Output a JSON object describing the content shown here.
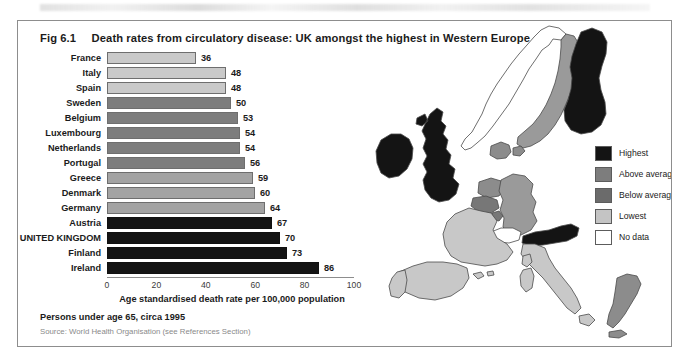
{
  "figure": {
    "number": "Fig 6.1",
    "title": "Death rates from circulatory disease:  UK amongst the highest in Western Europe",
    "footnote": "Persons under age 65, circa 1995",
    "source": "Source: World Health Organisation (see References Section)"
  },
  "chart_data": {
    "type": "bar",
    "orientation": "horizontal",
    "title": "Death rates from circulatory disease: UK amongst the highest in Western Europe",
    "xlabel": "Age standardised death rate per 100,000 population",
    "ylabel": "",
    "xlim": [
      0,
      100
    ],
    "xticks": [
      "0",
      "20",
      "40",
      "60",
      "80",
      "100"
    ],
    "grid": false,
    "legend_position": "map-right",
    "categories": [
      "France",
      "Italy",
      "Spain",
      "Sweden",
      "Belgium",
      "Luxembourg",
      "Netherlands",
      "Portugal",
      "Greece",
      "Denmark",
      "Germany",
      "Austria",
      "UNITED KINGDOM",
      "Finland",
      "Ireland"
    ],
    "values": [
      36,
      48,
      48,
      50,
      53,
      54,
      54,
      56,
      59,
      60,
      64,
      67,
      70,
      73,
      86
    ],
    "bands": [
      "Lowest",
      "Lowest",
      "Lowest",
      "Below average",
      "Below average",
      "Below average",
      "Below average",
      "Below average",
      "Above average",
      "Above average",
      "Above average",
      "Highest",
      "Highest",
      "Highest",
      "Highest"
    ],
    "bar_colors": [
      "#c9c9c9",
      "#c9c9c9",
      "#c9c9c9",
      "#7d7d7d",
      "#7d7d7d",
      "#7d7d7d",
      "#7d7d7d",
      "#7d7d7d",
      "#a3a3a3",
      "#a3a3a3",
      "#a3a3a3",
      "#141414",
      "#141414",
      "#141414",
      "#141414"
    ]
  },
  "legend": {
    "items": [
      {
        "label": "Highest",
        "color": "#141414"
      },
      {
        "label": "Above average",
        "color": "#7d7d7d"
      },
      {
        "label": "Below average",
        "color": "#6b6b6b"
      },
      {
        "label": "Lowest",
        "color": "#c4c4c4"
      },
      {
        "label": "No data",
        "color": "#ffffff"
      }
    ]
  },
  "map": {
    "name": "western-europe-choropleth",
    "regions": [
      {
        "name": "Ireland",
        "band": "Highest",
        "color": "#141414"
      },
      {
        "name": "United Kingdom",
        "band": "Highest",
        "color": "#141414"
      },
      {
        "name": "Finland",
        "band": "Highest",
        "color": "#141414"
      },
      {
        "name": "Austria",
        "band": "Highest",
        "color": "#141414"
      },
      {
        "name": "Sweden",
        "band": "Below average",
        "color": "#9a9a9a"
      },
      {
        "name": "Denmark",
        "band": "Above average",
        "color": "#8c8c8c"
      },
      {
        "name": "Netherlands",
        "band": "Below average",
        "color": "#8c8c8c"
      },
      {
        "name": "Belgium",
        "band": "Below average",
        "color": "#777777"
      },
      {
        "name": "Luxembourg",
        "band": "Below average",
        "color": "#777777"
      },
      {
        "name": "Germany",
        "band": "Above average",
        "color": "#9a9a9a"
      },
      {
        "name": "France",
        "band": "Lowest",
        "color": "#c8c8c8"
      },
      {
        "name": "Spain",
        "band": "Lowest",
        "color": "#c8c8c8"
      },
      {
        "name": "Portugal",
        "band": "Lowest",
        "color": "#c8c8c8"
      },
      {
        "name": "Italy",
        "band": "Lowest",
        "color": "#c8c8c8"
      },
      {
        "name": "Greece",
        "band": "Above average",
        "color": "#8c8c8c"
      },
      {
        "name": "Norway",
        "band": "No data",
        "color": "#ffffff"
      },
      {
        "name": "Switzerland",
        "band": "No data",
        "color": "#ffffff"
      }
    ]
  }
}
